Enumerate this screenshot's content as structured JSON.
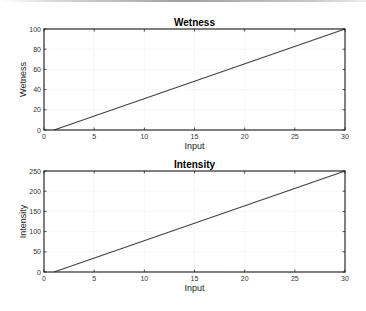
{
  "chart_data": [
    {
      "type": "line",
      "title": "Wetness",
      "xlabel": "Input",
      "ylabel": "Wetness",
      "xlim": [
        0,
        30
      ],
      "ylim": [
        0,
        100
      ],
      "xticks": [
        0,
        5,
        10,
        15,
        20,
        25,
        30
      ],
      "yticks": [
        0,
        20,
        40,
        60,
        80,
        100
      ],
      "grid": true,
      "series": [
        {
          "name": "Wetness",
          "x": [
            1,
            30
          ],
          "y": [
            0,
            100
          ],
          "color": "#404040"
        }
      ]
    },
    {
      "type": "line",
      "title": "Intensity",
      "xlabel": "Input",
      "ylabel": "Intensity",
      "xlim": [
        0,
        30
      ],
      "ylim": [
        0,
        250
      ],
      "xticks": [
        0,
        5,
        10,
        15,
        20,
        25,
        30
      ],
      "yticks": [
        0,
        50,
        100,
        150,
        200,
        250
      ],
      "grid": true,
      "series": [
        {
          "name": "Intensity",
          "x": [
            1,
            30
          ],
          "y": [
            0,
            250
          ],
          "color": "#404040"
        }
      ]
    }
  ]
}
